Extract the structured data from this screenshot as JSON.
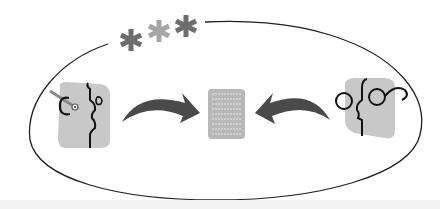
{
  "diagram": {
    "colors": {
      "outline": "#222222",
      "face_bg": "#c8c8c8",
      "arrow": "#4a4a4a",
      "document": "#b8b8b8",
      "document_lines": "#e6e6e6",
      "star_dark": "#6e6e6e",
      "star_light": "#a6a6a6",
      "ink": "#111111",
      "strip": "#f4f4f4"
    },
    "stars": [
      {
        "icon": "asterisk-icon",
        "shade": "dark"
      },
      {
        "icon": "asterisk-icon",
        "shade": "light"
      },
      {
        "icon": "asterisk-icon",
        "shade": "dark"
      }
    ],
    "left_figure": {
      "icon": "profile-face-with-monocle-icon",
      "facing": "right"
    },
    "left_arrow": {
      "icon": "curved-arrow-right-icon",
      "direction": "right"
    },
    "center": {
      "icon": "document-icon",
      "text_lines": 9
    },
    "right_arrow": {
      "icon": "curved-arrow-left-icon",
      "direction": "left"
    },
    "right_figure": {
      "icon": "profile-face-with-spectacles-icon",
      "facing": "left"
    }
  }
}
